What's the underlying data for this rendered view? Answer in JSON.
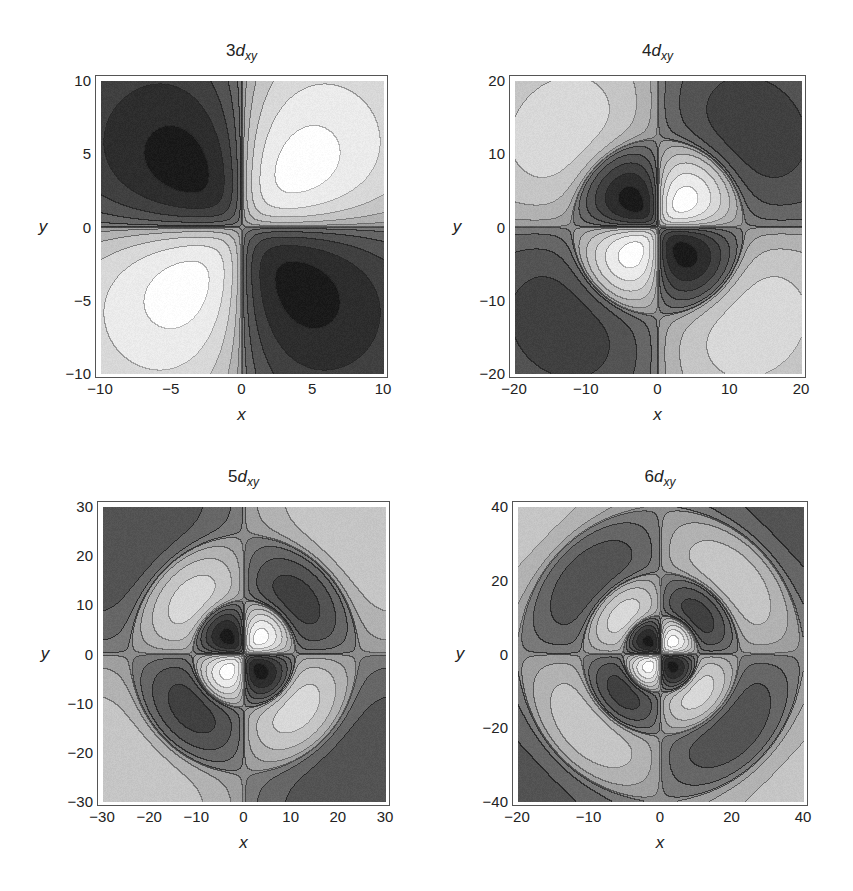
{
  "figure": {
    "background": "#ffffff",
    "colors": {
      "zero_level": "#8c8c8c",
      "most_negative": "#0a0a0a",
      "most_positive": "#ffffff",
      "contour_line": "#4a4a4a"
    }
  },
  "chart_data": [
    {
      "type": "heatmap",
      "subtype": "contour",
      "title": "3d_xy",
      "title_parts": {
        "n": "3",
        "l": "d",
        "sub": "xy"
      },
      "xlabel": "x",
      "ylabel": "y",
      "xlim": [
        -10,
        10
      ],
      "ylim": [
        -10,
        10
      ],
      "xticks": [
        -10,
        -5,
        0,
        5,
        10
      ],
      "yticks": [
        -10,
        -5,
        0,
        5,
        10
      ],
      "function": "psi_3dxy(x,y)",
      "radial_nodes": 0,
      "lobes": {
        "dark": [
          "upper-left",
          "lower-right"
        ],
        "light": [
          "upper-right",
          "lower-left"
        ]
      },
      "extrema_approx": [
        [
          -2.5,
          2.5
        ],
        [
          2.5,
          2.5
        ],
        [
          -2.5,
          -2.5
        ],
        [
          2.5,
          -2.5
        ]
      ],
      "grid": false
    },
    {
      "type": "heatmap",
      "subtype": "contour",
      "title": "4d_xy",
      "title_parts": {
        "n": "4",
        "l": "d",
        "sub": "xy"
      },
      "xlabel": "x",
      "ylabel": "y",
      "xlim": [
        -20,
        20
      ],
      "ylim": [
        -20,
        20
      ],
      "xticks": [
        -20,
        -10,
        0,
        10,
        20
      ],
      "yticks": [
        -20,
        -10,
        0,
        10,
        20
      ],
      "function": "psi_4dxy(x,y)",
      "radial_nodes": 1,
      "lobes": {
        "inner_dark": [
          "upper-left",
          "lower-right"
        ],
        "inner_light": [
          "upper-right",
          "lower-left"
        ],
        "outer_dark": [
          "upper-right",
          "lower-left"
        ],
        "outer_light": [
          "upper-left",
          "lower-right"
        ]
      },
      "grid": false
    },
    {
      "type": "heatmap",
      "subtype": "contour",
      "title": "5d_xy",
      "title_parts": {
        "n": "5",
        "l": "d",
        "sub": "xy"
      },
      "xlabel": "x",
      "ylabel": "y",
      "xlim": [
        -30,
        30
      ],
      "ylim": [
        -30,
        30
      ],
      "xticks": [
        -30,
        -20,
        -10,
        0,
        10,
        20,
        30
      ],
      "yticks": [
        -30,
        -20,
        -10,
        0,
        10,
        20,
        30
      ],
      "function": "psi_5dxy(x,y)",
      "radial_nodes": 2,
      "grid": false
    },
    {
      "type": "heatmap",
      "subtype": "contour",
      "title": "6d_xy",
      "title_parts": {
        "n": "6",
        "l": "d",
        "sub": "xy"
      },
      "xlabel": "x",
      "ylabel": "y",
      "xlim": [
        -40,
        40
      ],
      "ylim": [
        -40,
        40
      ],
      "xticks": [
        -20,
        -10,
        0,
        20,
        40
      ],
      "yticks": [
        -40,
        -20,
        0,
        20,
        40
      ],
      "xtick_labels_note": "x-axis tick labels printed as -20, -10, 0, 20, 40 (as shown)",
      "function": "psi_6dxy(x,y)",
      "radial_nodes": 3,
      "grid": false
    }
  ],
  "panels": [
    {
      "n": 3,
      "title_n": "3",
      "title_l": "d",
      "title_sub": "xy",
      "xlabel": "x",
      "ylabel": "y",
      "frame": {
        "left": 95,
        "top": 75,
        "width": 293,
        "height": 303
      },
      "range": 10,
      "xticks": [
        {
          "v": -10,
          "label": "−10"
        },
        {
          "v": -5,
          "label": "−5"
        },
        {
          "v": 0,
          "label": "0"
        },
        {
          "v": 5,
          "label": "5"
        },
        {
          "v": 10,
          "label": "10"
        }
      ],
      "yticks": [
        {
          "v": 10,
          "label": "10"
        },
        {
          "v": 5,
          "label": "5"
        },
        {
          "v": 0,
          "label": "0"
        },
        {
          "v": -5,
          "label": "−5"
        },
        {
          "v": -10,
          "label": "−10"
        }
      ]
    },
    {
      "n": 4,
      "title_n": "4",
      "title_l": "d",
      "title_sub": "xy",
      "xlabel": "x",
      "ylabel": "y",
      "frame": {
        "left": 509,
        "top": 75,
        "width": 297,
        "height": 303
      },
      "range": 20,
      "xticks": [
        {
          "v": -20,
          "label": "−20"
        },
        {
          "v": -10,
          "label": "−10"
        },
        {
          "v": 0,
          "label": "0"
        },
        {
          "v": 10,
          "label": "10"
        },
        {
          "v": 20,
          "label": "20"
        }
      ],
      "yticks": [
        {
          "v": 20,
          "label": "20"
        },
        {
          "v": 10,
          "label": "10"
        },
        {
          "v": 0,
          "label": "0"
        },
        {
          "v": -10,
          "label": "−10"
        },
        {
          "v": -20,
          "label": "−20"
        }
      ]
    },
    {
      "n": 5,
      "title_n": "5",
      "title_l": "d",
      "title_sub": "xy",
      "xlabel": "x",
      "ylabel": "y",
      "frame": {
        "left": 97,
        "top": 501,
        "width": 293,
        "height": 305
      },
      "range": 30,
      "xticks": [
        {
          "v": -30,
          "label": "−30"
        },
        {
          "v": -20,
          "label": "−20"
        },
        {
          "v": -10,
          "label": "−10"
        },
        {
          "v": 0,
          "label": "0"
        },
        {
          "v": 10,
          "label": "10"
        },
        {
          "v": 20,
          "label": "20"
        },
        {
          "v": 30,
          "label": "30"
        }
      ],
      "yticks": [
        {
          "v": 30,
          "label": "30"
        },
        {
          "v": 20,
          "label": "20"
        },
        {
          "v": 10,
          "label": "10"
        },
        {
          "v": 0,
          "label": "0"
        },
        {
          "v": -10,
          "label": "−10"
        },
        {
          "v": -20,
          "label": "−20"
        },
        {
          "v": -30,
          "label": "−30"
        }
      ]
    },
    {
      "n": 6,
      "title_n": "6",
      "title_l": "d",
      "title_sub": "xy",
      "xlabel": "x",
      "ylabel": "y",
      "frame": {
        "left": 512,
        "top": 501,
        "width": 296,
        "height": 305
      },
      "range": 40,
      "xticks": [
        {
          "pos": 0.0,
          "label": "−20"
        },
        {
          "pos": 0.25,
          "label": "−10"
        },
        {
          "pos": 0.5,
          "label": "0"
        },
        {
          "pos": 0.75,
          "label": "20"
        },
        {
          "pos": 1.0,
          "label": "40"
        }
      ],
      "yticks": [
        {
          "v": 40,
          "label": "40"
        },
        {
          "v": 20,
          "label": "20"
        },
        {
          "v": 0,
          "label": "0"
        },
        {
          "v": -20,
          "label": "−20"
        },
        {
          "v": -40,
          "label": "−40"
        }
      ]
    }
  ]
}
